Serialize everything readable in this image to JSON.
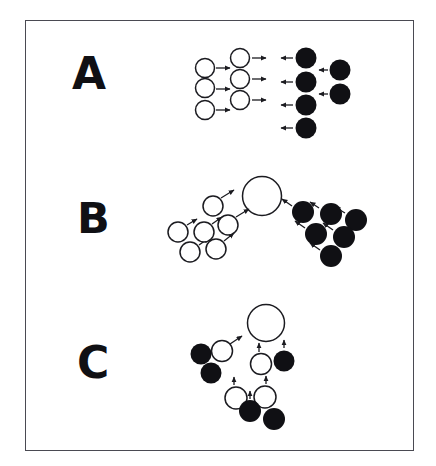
{
  "figure": {
    "caption_letters": [
      "A",
      "B",
      "C"
    ],
    "background_color": "#ffffff",
    "frame_color": "#4a4a52",
    "open_circle_stroke": "#1b1b20",
    "filled_circle_color": "#101014",
    "arrow_color": "#1b1b20",
    "frame": {
      "x": 25,
      "y": 20,
      "width": 389,
      "height": 431
    }
  },
  "panels": [
    {
      "id": "A",
      "label": "A",
      "label_position": {
        "x": 72,
        "y": 52
      },
      "groups": [
        {
          "id": "A-left-open-cluster",
          "name": "open-circle-column-pair",
          "fill": "open",
          "radius": 9.5,
          "circles": [
            {
              "cx": 205,
              "cy": 68
            },
            {
              "cx": 205,
              "cy": 88
            },
            {
              "cx": 205,
              "cy": 110
            },
            {
              "cx": 240,
              "cy": 58
            },
            {
              "cx": 240,
              "cy": 79
            },
            {
              "cx": 240,
              "cy": 100
            }
          ],
          "arrows": [
            {
              "x1": 216,
              "y1": 68,
              "x2": 230,
              "y2": 68
            },
            {
              "x1": 216,
              "y1": 89,
              "x2": 230,
              "y2": 89
            },
            {
              "x1": 216,
              "y1": 110,
              "x2": 230,
              "y2": 110
            },
            {
              "x1": 252,
              "y1": 58,
              "x2": 266,
              "y2": 58
            },
            {
              "x1": 252,
              "y1": 79,
              "x2": 266,
              "y2": 79
            },
            {
              "x1": 252,
              "y1": 100,
              "x2": 266,
              "y2": 100
            }
          ]
        },
        {
          "id": "A-right-filled-cluster",
          "name": "filled-circle-column-pair",
          "fill": "filled",
          "radius": 10.5,
          "circles": [
            {
              "cx": 306,
              "cy": 58
            },
            {
              "cx": 306,
              "cy": 82
            },
            {
              "cx": 306,
              "cy": 105
            },
            {
              "cx": 306,
              "cy": 128
            },
            {
              "cx": 340,
              "cy": 70
            },
            {
              "cx": 340,
              "cy": 94
            }
          ],
          "arrows": [
            {
              "x1": 293,
              "y1": 58,
              "x2": 281,
              "y2": 58
            },
            {
              "x1": 293,
              "y1": 82,
              "x2": 281,
              "y2": 82
            },
            {
              "x1": 293,
              "y1": 105,
              "x2": 281,
              "y2": 105
            },
            {
              "x1": 293,
              "y1": 128,
              "x2": 281,
              "y2": 128
            },
            {
              "x1": 328,
              "y1": 70,
              "x2": 319,
              "y2": 70
            },
            {
              "x1": 328,
              "y1": 94,
              "x2": 319,
              "y2": 94
            }
          ]
        }
      ]
    },
    {
      "id": "B",
      "label": "B",
      "label_position": {
        "x": 77,
        "y": 197
      },
      "groups": [
        {
          "id": "B-large-open-circle",
          "name": "large-open-circle",
          "fill": "open",
          "radius": 19.5,
          "circles": [
            {
              "cx": 262,
              "cy": 196
            }
          ],
          "arrows": []
        },
        {
          "id": "B-left-open-cluster",
          "name": "open-circle-diagonal-cluster",
          "fill": "open",
          "radius": 10,
          "circles": [
            {
              "cx": 213,
              "cy": 206
            },
            {
              "cx": 228,
              "cy": 225
            },
            {
              "cx": 204,
              "cy": 232
            },
            {
              "cx": 178,
              "cy": 232
            },
            {
              "cx": 190,
              "cy": 252
            },
            {
              "cx": 216,
              "cy": 249
            }
          ],
          "arrows": [
            {
              "x1": 221,
              "y1": 198,
              "x2": 234,
              "y2": 190
            },
            {
              "x1": 236,
              "y1": 217,
              "x2": 249,
              "y2": 209
            },
            {
              "x1": 212,
              "y1": 224,
              "x2": 222,
              "y2": 217
            },
            {
              "x1": 187,
              "y1": 225,
              "x2": 197,
              "y2": 219
            },
            {
              "x1": 199,
              "y1": 245,
              "x2": 209,
              "y2": 238
            },
            {
              "x1": 224,
              "y1": 241,
              "x2": 234,
              "y2": 233
            }
          ]
        },
        {
          "id": "B-right-filled-cluster",
          "name": "filled-circle-triangular-cluster",
          "fill": "filled",
          "radius": 11,
          "circles": [
            {
              "cx": 303,
              "cy": 212
            },
            {
              "cx": 331,
              "cy": 214
            },
            {
              "cx": 356,
              "cy": 220
            },
            {
              "cx": 316,
              "cy": 234
            },
            {
              "cx": 344,
              "cy": 237
            },
            {
              "cx": 331,
              "cy": 256
            }
          ],
          "arrows": [
            {
              "x1": 292,
              "y1": 206,
              "x2": 282,
              "y2": 199
            },
            {
              "x1": 319,
              "y1": 208,
              "x2": 310,
              "y2": 202
            },
            {
              "x1": 345,
              "y1": 213,
              "x2": 335,
              "y2": 207
            },
            {
              "x1": 305,
              "y1": 228,
              "x2": 295,
              "y2": 221
            },
            {
              "x1": 333,
              "y1": 230,
              "x2": 323,
              "y2": 223
            },
            {
              "x1": 320,
              "y1": 250,
              "x2": 310,
              "y2": 243
            }
          ]
        }
      ]
    },
    {
      "id": "C",
      "label": "C",
      "label_position": {
        "x": 77,
        "y": 341
      },
      "groups": [
        {
          "id": "C-large-open-circle",
          "name": "large-open-circle",
          "fill": "open",
          "radius": 18.5,
          "circles": [
            {
              "cx": 266,
              "cy": 323
            }
          ],
          "arrows": []
        },
        {
          "id": "C-group-upper-left",
          "name": "mixed-circle-trio-upper-left",
          "fill": "mixed",
          "radius": 10.5,
          "circles": [
            {
              "cx": 222,
              "cy": 351,
              "fill": "open"
            },
            {
              "cx": 201,
              "cy": 354,
              "fill": "filled"
            },
            {
              "cx": 211,
              "cy": 373,
              "fill": "filled"
            }
          ],
          "arrows": [
            {
              "x1": 230,
              "y1": 344,
              "x2": 242,
              "y2": 336
            }
          ]
        },
        {
          "id": "C-group-middle-right",
          "name": "mixed-circle-pair-middle",
          "fill": "mixed",
          "radius": 10.5,
          "circles": [
            {
              "cx": 261,
              "cy": 364,
              "fill": "open"
            },
            {
              "cx": 284,
              "cy": 361,
              "fill": "filled"
            }
          ],
          "arrows": [
            {
              "x1": 259,
              "y1": 352,
              "x2": 259,
              "y2": 343
            },
            {
              "x1": 284,
              "y1": 348,
              "x2": 284,
              "y2": 340
            }
          ]
        },
        {
          "id": "C-group-bottom",
          "name": "mixed-circle-quad-bottom",
          "fill": "mixed",
          "radius": 11,
          "circles": [
            {
              "cx": 236,
              "cy": 398,
              "fill": "open"
            },
            {
              "cx": 265,
              "cy": 397,
              "fill": "open"
            },
            {
              "cx": 250,
              "cy": 411,
              "fill": "filled"
            },
            {
              "cx": 274,
              "cy": 419,
              "fill": "filled"
            }
          ],
          "arrows": [
            {
              "x1": 234,
              "y1": 385,
              "x2": 234,
              "y2": 377
            },
            {
              "x1": 250,
              "y1": 399,
              "x2": 250,
              "y2": 391
            },
            {
              "x1": 266,
              "y1": 384,
              "x2": 266,
              "y2": 376
            }
          ]
        }
      ]
    }
  ]
}
